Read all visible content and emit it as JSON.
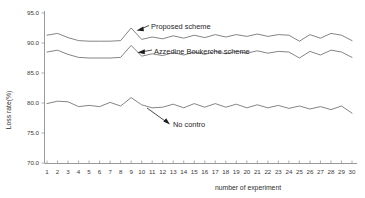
{
  "chart_data": {
    "type": "line",
    "title": "",
    "xlabel": "number of experiment",
    "ylabel": "Loss rate(%)",
    "xlim": [
      1,
      30
    ],
    "ylim": [
      70.0,
      95.0
    ],
    "yticks": [
      "95.0",
      "90.0",
      "85.0",
      "80.0",
      "75.0",
      "70.0"
    ],
    "ytick_values": [
      95.0,
      90.0,
      85.0,
      80.0,
      75.0,
      70.0
    ],
    "xticks": [
      "1",
      "2",
      "3",
      "4",
      "5",
      "6",
      "7",
      "8",
      "9",
      "10",
      "11",
      "12",
      "13",
      "14",
      "15",
      "16",
      "17",
      "18",
      "19",
      "20",
      "21",
      "22",
      "23",
      "24",
      "25",
      "26",
      "27",
      "28",
      "29",
      "30"
    ],
    "grid": false,
    "legend_position": "inline-annotations",
    "x": [
      1,
      2,
      3,
      4,
      5,
      6,
      7,
      8,
      9,
      10,
      11,
      12,
      13,
      14,
      15,
      16,
      17,
      18,
      19,
      20,
      21,
      22,
      23,
      24,
      25,
      26,
      27,
      28,
      29,
      30
    ],
    "series": [
      {
        "name": "Proposed scheme",
        "values": [
          91.3,
          91.6,
          90.9,
          90.4,
          90.3,
          90.3,
          90.3,
          90.4,
          92.5,
          90.6,
          91.0,
          90.7,
          91.2,
          90.8,
          91.3,
          90.9,
          91.4,
          91.0,
          91.4,
          91.1,
          91.5,
          91.1,
          91.4,
          91.3,
          90.3,
          91.4,
          90.8,
          91.6,
          91.3,
          90.4
        ]
      },
      {
        "name": "Azzedine Boukerche scheme",
        "values": [
          88.5,
          88.8,
          88.1,
          87.6,
          87.5,
          87.5,
          87.5,
          87.6,
          89.6,
          87.8,
          88.2,
          87.9,
          88.4,
          88.0,
          88.5,
          88.1,
          88.6,
          88.2,
          88.6,
          88.3,
          88.7,
          88.3,
          88.6,
          88.5,
          87.5,
          88.6,
          88.0,
          88.8,
          88.5,
          87.6
        ]
      },
      {
        "name": "No contro",
        "values": [
          79.9,
          80.3,
          80.2,
          79.4,
          79.6,
          79.4,
          80.1,
          79.5,
          80.9,
          79.7,
          79.2,
          79.3,
          79.8,
          79.2,
          79.9,
          79.3,
          79.9,
          79.3,
          79.8,
          79.2,
          79.7,
          79.2,
          79.6,
          79.1,
          79.5,
          79.0,
          79.4,
          78.9,
          79.5,
          78.3
        ]
      }
    ],
    "annotations": [
      {
        "text": "Proposed scheme",
        "series": "Proposed scheme"
      },
      {
        "text": "Azzedine Boukerche scheme",
        "series": "Azzedine Boukerche scheme"
      },
      {
        "text": "No contro",
        "series": "No contro"
      }
    ]
  }
}
